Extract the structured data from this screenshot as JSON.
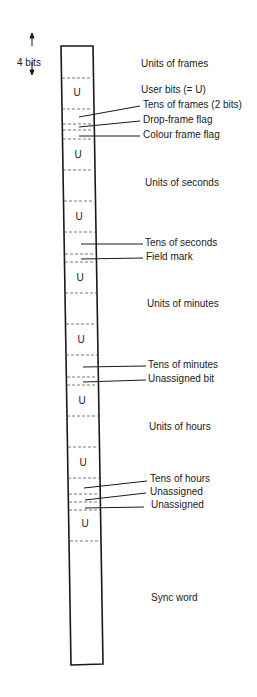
{
  "diagram": {
    "scale_label": "4 bits",
    "user_bit_symbol": "U",
    "labels": {
      "units_of_frames": "Units of frames",
      "user_bits": "User bits (= U)",
      "tens_of_frames": "Tens of frames (2 bits)",
      "drop_frame_flag": "Drop-frame flag",
      "colour_frame_flag": "Colour frame flag",
      "units_of_seconds": "Units of seconds",
      "tens_of_seconds": "Tens of seconds",
      "field_mark": "Field mark",
      "units_of_minutes": "Units of minutes",
      "tens_of_minutes": "Tens of minutes",
      "unassigned_bit": "Unassigned bit",
      "units_of_hours": "Units of hours",
      "tens_of_hours": "Tens of hours",
      "unassigned_1": "Unassigned",
      "unassigned_2": "Unassigned",
      "sync_word": "Sync word"
    }
  }
}
